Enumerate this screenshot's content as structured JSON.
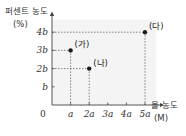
{
  "chart_data": {
    "type": "scatter",
    "title": "",
    "ylabel": "퍼센트 농도",
    "ylabel_unit": "(%)",
    "xlabel": "몰 농도",
    "xlabel_unit": "(M)",
    "origin_label": "0",
    "x_ticks": [
      {
        "value": 1,
        "label": "a"
      },
      {
        "value": 2,
        "label": "2a"
      },
      {
        "value": 3,
        "label": "3a"
      },
      {
        "value": 4,
        "label": "4a"
      },
      {
        "value": 5,
        "label": "5a"
      }
    ],
    "y_ticks": [
      {
        "value": 1,
        "label": "b"
      },
      {
        "value": 2,
        "label": "2b"
      },
      {
        "value": 3,
        "label": "3b"
      },
      {
        "value": 4,
        "label": "4b"
      }
    ],
    "xlim": [
      0,
      5.8
    ],
    "ylim": [
      0,
      4.8
    ],
    "grid": false,
    "points": [
      {
        "name": "(가)",
        "x": 1,
        "y": 3
      },
      {
        "name": "(나)",
        "x": 2,
        "y": 2
      },
      {
        "name": "(다)",
        "x": 5,
        "y": 4
      }
    ],
    "guide_lines": "dashed lines from each point to both axes",
    "colors": {
      "point": "#1a1a1a",
      "axis": "#444444",
      "dash": "#666666",
      "plot_bg": "#f4f4f4"
    }
  }
}
